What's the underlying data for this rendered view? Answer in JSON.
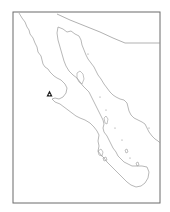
{
  "map": {
    "subject": "Baja California peninsula",
    "colors": {
      "background": "#ffffff",
      "frame": "#6b6b6b",
      "coastline": "#9a9a9a",
      "border": "#8f8f8f",
      "marker": "#1a1a1a"
    },
    "frame": {
      "x": 13,
      "y": 12,
      "width": 147,
      "height": 191
    },
    "layers": {
      "pacific_coast": "M19,13 L22,18 L25,22 L27,27 L29,30 L30,34 L33,38 L35,43 L37,47 L38,52 L41,56 L42,60 L43,64 L45,67 L48,69 L50,72 L54,76 L57,78 L61,80 L65,84 L67,88 L66,93 L63,97 L59,99 L55,98 L52,99 L55,102 L60,104 L64,107 L68,110 L72,113 L76,116 L80,118 L85,120 L90,123 L94,127 L97,131 L99,135 L98,141 L99,146 L98,151 L101,155 L104,158 L107,162 L111,166 L115,170 L119,174 L123,178 L127,182 L131,185 L136,187 L141,186 L145,183 L148,178 L149,172 L147,167",
      "gulf_coast_peninsula": "M58,27 L57,33 L58,40 L60,47 L62,54 L64,61 L66,66 L69,71 L73,75 L77,78 L80,82 L83,86 L86,89 L89,92 L91,96 L93,100 L95,104 L97,108 L99,112 L101,116 L103,120 L104,124 L103,128 L104,132 L107,136 L109,140 L111,144 L113,148 L116,152 L118,156 L121,159 L124,162 L128,164 L132,166 L137,166 L142,166 L147,167",
      "gulf_coast_mainland": "M58,27 L63,29 L67,32 L71,31 L75,34 L79,36 L81,40 L82,45 L84,50 L86,55 L88,59 L91,63 L94,67 L96,71 L98,75 L101,79 L104,84 L107,88 L110,92 L113,95 L116,97 L120,99 L124,100 L127,103 L128,107 L129,111 L131,115 L134,118 L138,120 L142,122 L145,124 L147,128 L149,132 L152,136 L155,139 L158,141 L160,143",
      "us_mexico_border": "M57,14 L70,20 L85,26 L100,32 L113,38 L125,43 L160,43",
      "islands": [
        "M77,73 L80,71 L83,74 L84,79 L82,84 L79,82 L77,78 Z",
        "M104,118 L106,116 L108,119 L107,124 L105,123 Z",
        "M98,151 L101,149 L103,152 L102,156 L99,155 Z",
        "M103,158 L106,157 L107,160 L104,161 Z",
        "M125,150 L127,149 L128,152 L126,153 Z",
        "M136,163 L138,162 L139,165 L137,166 Z"
      ],
      "dots": [
        {
          "x": 100,
          "y": 97
        },
        {
          "x": 106,
          "y": 110
        },
        {
          "x": 115,
          "y": 128
        },
        {
          "x": 122,
          "y": 140
        },
        {
          "x": 88,
          "y": 54
        },
        {
          "x": 130,
          "y": 158
        },
        {
          "x": 149,
          "y": 128
        }
      ]
    },
    "marker": {
      "symbol": "triangle",
      "x": 49.5,
      "y": 94,
      "label": "site marker"
    }
  }
}
